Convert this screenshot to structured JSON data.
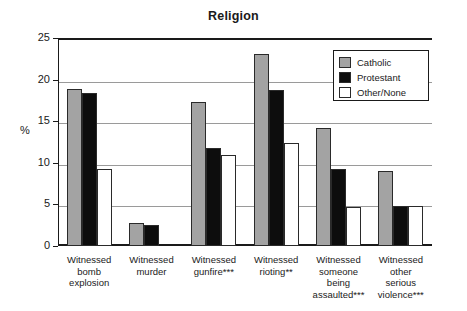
{
  "chart_data": {
    "type": "bar",
    "title": "Religion",
    "xlabel": "",
    "ylabel": "%",
    "ylim": [
      0,
      25
    ],
    "yticks": [
      0,
      5,
      10,
      15,
      20,
      25
    ],
    "grid": true,
    "legend_position": "top-right",
    "categories": [
      "Witnessed bomb explosion",
      "Witnessed murder",
      "Witnessed gunfire***",
      "Witnessed rioting**",
      "Witnessed someone being assaulted***",
      "Witnessed other serious violence***"
    ],
    "category_lines": [
      [
        "Witnessed",
        "bomb",
        "explosion"
      ],
      [
        "Witnessed",
        "murder"
      ],
      [
        "Witnessed",
        "gunfire***"
      ],
      [
        "Witnessed",
        "rioting**"
      ],
      [
        "Witnessed",
        "someone",
        "being",
        "assaulted***"
      ],
      [
        "Witnessed",
        "other",
        "serious",
        "violence***"
      ]
    ],
    "series": [
      {
        "name": "Catholic",
        "color": "#a3a3a3",
        "values": [
          18.9,
          2.8,
          17.3,
          23.1,
          14.2,
          9.0
        ]
      },
      {
        "name": "Protestant",
        "color": "#0d0d0d",
        "values": [
          18.4,
          2.5,
          11.8,
          18.8,
          9.2,
          4.8
        ]
      },
      {
        "name": "Other/None",
        "color": "#ffffff",
        "values": [
          9.3,
          0,
          10.9,
          12.4,
          4.7,
          4.8
        ]
      }
    ]
  },
  "legend": {
    "items": [
      {
        "label": "Catholic"
      },
      {
        "label": "Protestant"
      },
      {
        "label": "Other/None"
      }
    ]
  },
  "axis": {
    "unit": "%",
    "ticks": [
      "25",
      "20",
      "15",
      "10",
      "5",
      "0"
    ]
  }
}
